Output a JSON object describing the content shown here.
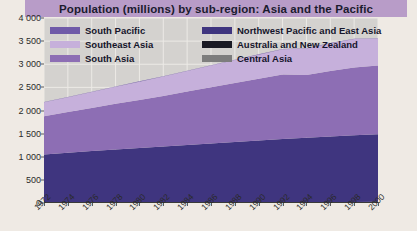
{
  "chart_data": {
    "type": "area",
    "title": "Population (millions) by sub-region: Asia and the Pacific",
    "xlabel": "",
    "ylabel": "",
    "stacked": true,
    "grid": true,
    "legend_position": "inside-top-left",
    "xlim": [
      1972,
      2000
    ],
    "ylim": [
      0,
      4000
    ],
    "ytick_step": 500,
    "x": [
      1972,
      1974,
      1976,
      1978,
      1980,
      1982,
      1984,
      1986,
      1988,
      1990,
      1992,
      1994,
      1996,
      1998,
      2000
    ],
    "xtick_labels": [
      "1972",
      "1974",
      "1976",
      "1978",
      "1980",
      "1982",
      "1984",
      "1986",
      "1988",
      "1990",
      "1992",
      "1994",
      "1996",
      "1998",
      "2000"
    ],
    "ytick_labels": [
      "0",
      "500",
      "1 000",
      "1 500",
      "2 000",
      "2 500",
      "3 000",
      "3 500",
      "4 000"
    ],
    "ytick_values": [
      0,
      500,
      1000,
      1500,
      2000,
      2500,
      3000,
      3500,
      4000
    ],
    "series": [
      {
        "name": "Australia and New Zealand",
        "color": "#1a1a24",
        "values": [
          17,
          18,
          18,
          19,
          19,
          20,
          20,
          21,
          21,
          22,
          23,
          23,
          24,
          24,
          25
        ]
      },
      {
        "name": "Northwest Pacific and East Asia",
        "color": "#3f357f",
        "values": [
          1030,
          1070,
          1105,
          1140,
          1170,
          1200,
          1235,
          1265,
          1300,
          1330,
          1360,
          1390,
          1415,
          1440,
          1460
        ]
      },
      {
        "name": "South Asia",
        "color": "#8d6eb4",
        "values": [
          830,
          880,
          930,
          985,
          1040,
          1095,
          1155,
          1215,
          1275,
          1335,
          1395,
          1355,
          1415,
          1465,
          1490
        ]
      },
      {
        "name": "Southeast Asia",
        "color": "#c6b0db",
        "values": [
          300,
          320,
          345,
          370,
          395,
          420,
          445,
          470,
          495,
          520,
          545,
          570,
          595,
          615,
          580
        ]
      },
      {
        "name": "South Pacific",
        "color": "#6f5aa8",
        "values": [
          5,
          5,
          5,
          6,
          6,
          6,
          6,
          7,
          7,
          7,
          7,
          8,
          8,
          8,
          8
        ]
      },
      {
        "name": "Central Asia",
        "color": "#7d7d7d",
        "values": [
          0,
          0,
          0,
          0,
          0,
          0,
          0,
          0,
          0,
          0,
          0,
          0,
          0,
          0,
          0
        ]
      }
    ],
    "totals": [
      2182,
      2293,
      2403,
      2520,
      2630,
      2741,
      2861,
      2978,
      3098,
      3214,
      3330,
      3346,
      3457,
      3552,
      3563
    ],
    "legend_entries": [
      {
        "label": "South Pacific",
        "color": "#6f5aa8"
      },
      {
        "label": "Northwest Pacific and East Asia",
        "color": "#3f357f"
      },
      {
        "label": "Southeast Asia",
        "color": "#c6b0db"
      },
      {
        "label": "Australia and New Zealand",
        "color": "#1a1a24"
      },
      {
        "label": "South Asia",
        "color": "#8d6eb4"
      },
      {
        "label": "Central Asia",
        "color": "#7d7d7d"
      }
    ],
    "colors": {
      "title_bar": "#b89cc8",
      "plot_background": "#d4d2cf",
      "gridline": "#eceae6",
      "page_background": "#efeae4",
      "axis_text": "#2a2a2a"
    }
  }
}
